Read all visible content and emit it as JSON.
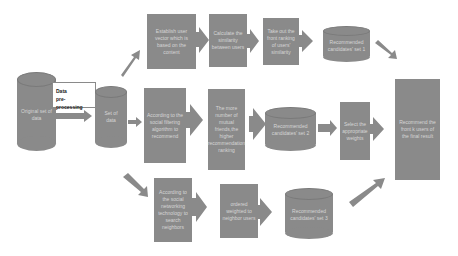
{
  "diagram": {
    "nodes": {
      "original_data": {
        "label": "Original set of data",
        "shape": "cylinder"
      },
      "preprocessing": {
        "label_line1": "Data",
        "label_line2": "pre-processing",
        "shape": "label-box"
      },
      "set_of_data": {
        "label": "Set of data",
        "shape": "cylinder"
      },
      "top_1": {
        "label": "Establish user vector which is based on the content",
        "shape": "box"
      },
      "top_2": {
        "label": "Calculate the similarity between users",
        "shape": "box"
      },
      "top_3": {
        "label": "Take out the front ranking of users' similarity",
        "shape": "box"
      },
      "cand_1": {
        "label": "Recommended candidates' set 1",
        "shape": "cylinder"
      },
      "mid_1": {
        "label": "According to the social filtering algorithm to recommend",
        "shape": "box"
      },
      "mid_2": {
        "label": "The more number of mutual friends,the higher recommendation ranking",
        "shape": "box"
      },
      "cand_2": {
        "label": "Recommended candidates' set 2",
        "shape": "cylinder"
      },
      "weights": {
        "label": "Select the appropriate weights",
        "shape": "box"
      },
      "final": {
        "label": "Recommend the front k users of the final result",
        "shape": "box"
      },
      "bot_1": {
        "label": "According to the social networking technology to search neighbors",
        "shape": "box"
      },
      "bot_2": {
        "label": "ordered weighted to neighbor users",
        "shape": "box"
      },
      "cand_3": {
        "label": "Recommended candidates' set 3",
        "shape": "cylinder"
      }
    },
    "colors": {
      "node_fill": "#8a8a8a",
      "node_text": "#d6d6d6",
      "arrow": "#8a8a8a",
      "background": "#ffffff"
    }
  }
}
